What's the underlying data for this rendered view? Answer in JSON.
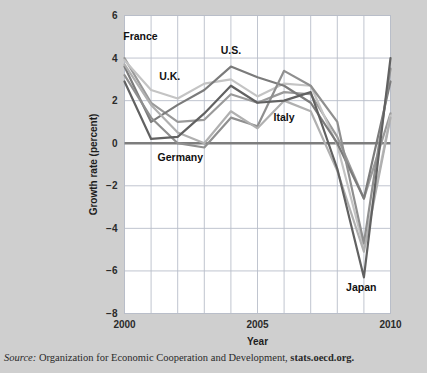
{
  "figure": {
    "background_color": "#cfcfcf",
    "plot_background_color": "#ffffff",
    "grid_color": "#b9bec9",
    "zero_line_color": "#7d7d7d",
    "axis_text_color": "#2b2b2b"
  },
  "source": {
    "prefix": "Source:",
    "text": " Organization for Economic Cooperation and Development, ",
    "url": "stats.oecd.org."
  },
  "chart_data": {
    "type": "line",
    "title": "",
    "xlabel": "Year",
    "ylabel": "Growth rate (percent)",
    "xlim": [
      2000,
      2010
    ],
    "ylim": [
      -8,
      6
    ],
    "xticks": [
      2000,
      2005,
      2010
    ],
    "xticklabels": [
      "2000",
      "2005",
      "2010"
    ],
    "yticks": [
      6,
      4,
      2,
      0,
      -2,
      -4,
      -6,
      -8
    ],
    "yticklabels": [
      "6",
      "4",
      "2",
      "0",
      "−2",
      "−4",
      "−6",
      "−8"
    ],
    "grid": true,
    "grid_x_every": 1,
    "grid_y_every": 2,
    "legend": "inline-annotations",
    "x": [
      2000,
      2001,
      2002,
      2003,
      2004,
      2005,
      2006,
      2007,
      2008,
      2009,
      2010
    ],
    "series": [
      {
        "name": "France",
        "color": "#9a9a9a",
        "label": "France",
        "label_x": 2000.6,
        "label_y": 4.85,
        "values": [
          4.0,
          1.9,
          1.0,
          1.1,
          2.3,
          1.9,
          2.4,
          2.3,
          0.3,
          -2.6,
          1.4
        ]
      },
      {
        "name": "U.K.",
        "color": "#c4c4c4",
        "label": "U.K.",
        "label_x": 2001.7,
        "label_y": 2.95,
        "values": [
          3.9,
          2.5,
          2.1,
          2.8,
          3.0,
          2.2,
          2.8,
          2.7,
          -0.1,
          -4.9,
          1.3
        ]
      },
      {
        "name": "U.S.",
        "color": "#7b7b7b",
        "label": "U.S.",
        "label_x": 2004.0,
        "label_y": 4.2,
        "values": [
          3.6,
          1.0,
          1.8,
          2.5,
          3.6,
          3.1,
          2.7,
          1.9,
          0.0,
          -2.6,
          2.9
        ]
      },
      {
        "name": "Germany",
        "color": "#8f8f8f",
        "label": "Germany",
        "label_x": 2002.1,
        "label_y": -0.85,
        "values": [
          3.2,
          1.2,
          0.0,
          -0.2,
          1.2,
          0.8,
          3.4,
          2.7,
          1.0,
          -4.7,
          3.5
        ]
      },
      {
        "name": "Italy",
        "color": "#b0b0b0",
        "label": "Italy",
        "label_x": 2006.0,
        "label_y": 1.05,
        "values": [
          3.7,
          1.8,
          0.5,
          0.0,
          1.5,
          0.7,
          2.0,
          1.5,
          -1.3,
          -5.1,
          1.2
        ]
      },
      {
        "name": "Japan",
        "color": "#616161",
        "label": "Japan",
        "label_x": 2008.9,
        "label_y": -6.95,
        "values": [
          2.9,
          0.2,
          0.3,
          1.4,
          2.7,
          1.9,
          2.0,
          2.4,
          -1.2,
          -6.3,
          4.0
        ]
      }
    ]
  }
}
